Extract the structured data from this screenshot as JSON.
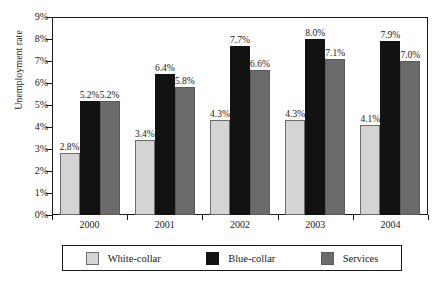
{
  "chart_data": {
    "type": "bar",
    "title": "",
    "subtitle": "",
    "xlabel": "",
    "ylabel": "Unemployment rate",
    "categories": [
      "2000",
      "2001",
      "2002",
      "2003",
      "2004"
    ],
    "series": [
      {
        "name": "White-collar",
        "color": "#d4d4d4",
        "values": [
          2.8,
          3.4,
          4.3,
          4.3,
          4.1
        ],
        "labels": [
          "2.8%",
          "3.4%",
          "4.3%",
          "4.3%",
          "4.1%"
        ]
      },
      {
        "name": "Blue-collar",
        "color": "#121212",
        "values": [
          5.2,
          6.4,
          7.7,
          8.0,
          7.9
        ],
        "labels": [
          "5.2%",
          "6.4%",
          "7.7%",
          "8.0%",
          "7.9%"
        ]
      },
      {
        "name": "Services",
        "color": "#6b6b6b",
        "values": [
          5.2,
          5.8,
          6.6,
          7.1,
          7.0
        ],
        "labels": [
          "5.2%",
          "5.8%",
          "6.6%",
          "7.1%",
          "7.0%"
        ]
      }
    ],
    "ylim": [
      0,
      9
    ],
    "ytick_values": [
      0,
      1,
      2,
      3,
      4,
      5,
      6,
      7,
      8,
      9
    ],
    "ytick_labels": [
      "0%",
      "1%",
      "2%",
      "3%",
      "4%",
      "5%",
      "6%",
      "7%",
      "8%",
      "9%"
    ],
    "grid": false,
    "legend_position": "bottom",
    "data_labels": true
  },
  "legend": {
    "items": [
      {
        "label": "White-collar",
        "swatch": "white-collar"
      },
      {
        "label": "Blue-collar",
        "swatch": "blue-collar"
      },
      {
        "label": "Services",
        "swatch": "services"
      }
    ]
  }
}
